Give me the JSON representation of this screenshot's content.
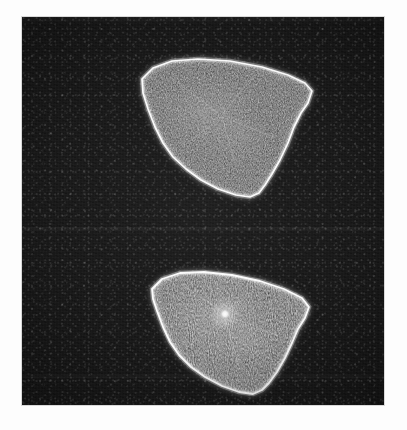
{
  "figure": {
    "kind": "fluorescence-micrograph",
    "page_background": "#fdfdfd",
    "panel": {
      "background": "#161616",
      "x": 22,
      "y": 17,
      "width": 362,
      "height": 388,
      "border_color": "#d9d9d9"
    },
    "caption": "",
    "scale_bar": null,
    "labels": []
  },
  "colors": {
    "background_dark": "#161616",
    "cortex_bright": "#ffffff",
    "cytoplasm_mid": "#6f6f6f",
    "cytoplasm_dim": "#3a3a3a",
    "punctum_bright": "#ffffff",
    "page_white": "#fdfdfd"
  },
  "objects": [
    {
      "id": "cell-upper",
      "name": "upper-cell",
      "description": "fan-shaped cell with bright cortical rim",
      "centroid": [
        196,
        107
      ],
      "bright_rim": true,
      "has_central_punctum": false,
      "outline_points": "120,62 131,51 150,44 176,42 208,44 240,50 266,58 283,66 290,74 286,86 279,96 272,110 266,126 258,143 250,157 243,168 237,176 228,180 214,178 196,172 179,163 164,152 151,140 141,126 133,110 126,92 121,76",
      "interior_highlight": [
        {
          "cx": 185,
          "cy": 95,
          "rx": 58,
          "ry": 40,
          "alpha": 0.3
        },
        {
          "cx": 215,
          "cy": 120,
          "rx": 40,
          "ry": 30,
          "alpha": 0.2
        }
      ]
    },
    {
      "id": "cell-lower",
      "name": "lower-cell",
      "description": "fan-shaped cell with bright cortical rim and bright central punctum",
      "centroid": [
        203,
        308
      ],
      "bright_rim": true,
      "has_central_punctum": true,
      "punctum": {
        "cx": 203,
        "cy": 297,
        "r": 7
      },
      "outline_points": "130,272 140,262 158,256 182,255 210,258 238,264 262,272 280,281 287,290 283,301 276,312 270,326 263,341 255,355 247,366 240,373 231,377 217,375 200,369 183,360 169,350 157,338 148,325 141,310 135,294 131,282",
      "interior_highlight": [
        {
          "cx": 196,
          "cy": 300,
          "rx": 58,
          "ry": 40,
          "alpha": 0.32
        },
        {
          "cx": 222,
          "cy": 325,
          "rx": 40,
          "ry": 28,
          "alpha": 0.2
        }
      ]
    }
  ],
  "annotations": {
    "object_count": 2,
    "modality": "fluorescence",
    "channel_count": 1
  }
}
